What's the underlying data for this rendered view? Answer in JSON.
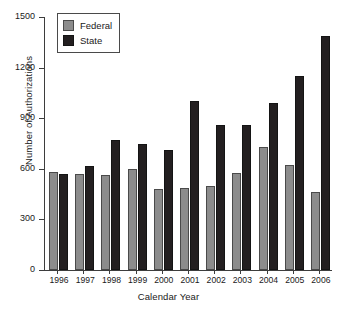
{
  "chart_data": {
    "type": "bar",
    "title": "",
    "xlabel": "Calendar Year",
    "ylabel": "Number of Authorizations",
    "categories": [
      "1996",
      "1997",
      "1998",
      "1999",
      "2000",
      "2001",
      "2002",
      "2003",
      "2004",
      "2005",
      "2006"
    ],
    "series": [
      {
        "name": "Federal",
        "color": "#8c8c8c",
        "values": [
          581,
          569,
          566,
          601,
          479,
          486,
          497,
          578,
          730,
          625,
          461
        ]
      },
      {
        "name": "State",
        "color": "#231f20",
        "values": [
          569,
          617,
          772,
          749,
          711,
          1005,
          861,
          860,
          989,
          1148,
          1389
        ]
      }
    ],
    "ylim": [
      0,
      1500
    ],
    "yticks": [
      0,
      300,
      600,
      900,
      1200,
      1500
    ],
    "ytick_labels": [
      "0",
      "300",
      "600",
      "900",
      "1200",
      "1500"
    ],
    "grid": false,
    "legend_position": "top-left",
    "legend_entries": [
      "Federal",
      "State"
    ]
  }
}
